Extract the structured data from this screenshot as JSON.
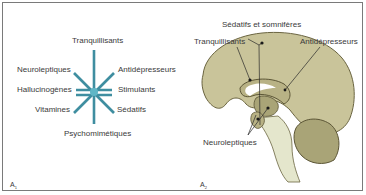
{
  "figure": {
    "panel_a1": {
      "label": "A",
      "label_sub": "1",
      "center_color": "#2f8fa3",
      "rays": [
        {
          "id": "tranquillisants",
          "label": "Tranquillisants"
        },
        {
          "id": "antidepresseurs",
          "label": "Antidépresseurs"
        },
        {
          "id": "stimulants",
          "label": "Stimulants"
        },
        {
          "id": "sedatifs",
          "label": "Sédatifs"
        },
        {
          "id": "psychomimetiques",
          "label": "Psychomimétiques"
        },
        {
          "id": "vitamines",
          "label": "Vitamines"
        },
        {
          "id": "hallucinogenes",
          "label": "Hallucinogènes"
        },
        {
          "id": "neuroleptiques",
          "label": "Neuroleptiques"
        }
      ]
    },
    "panel_a2": {
      "label": "A",
      "label_sub": "2",
      "brain_color": "#c9c49a",
      "labels": {
        "sedatifs_somniferes": "Sédatifs et somnifères",
        "tranquillisants": "Tranquillisants",
        "antidepresseurs": "Antidépresseurs",
        "neuroleptiques": "Neuroleptiques"
      }
    }
  }
}
